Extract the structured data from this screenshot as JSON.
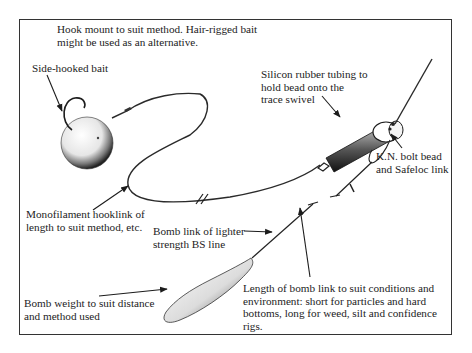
{
  "diagram": {
    "type": "fishing-rig-illustration",
    "labels": {
      "hook_mount": [
        "Hook mount to suit method. Hair-rigged bait",
        "might be used as an alternative."
      ],
      "side_hooked_bait": [
        "Side-hooked bait"
      ],
      "silicon_tubing": [
        "Silicon rubber tubing to",
        "hold bead onto the",
        "trace swivel"
      ],
      "kn_bolt_bead": [
        "K.N. bolt bead",
        "and Safeloc link"
      ],
      "monofilament": [
        "Monofilament hooklink of",
        "length to suit method, etc."
      ],
      "bomb_link": [
        "Bomb link of lighter",
        "strength BS line"
      ],
      "bomb_weight": [
        "Bomb weight to suit distance",
        "and method used"
      ],
      "bomb_link_length": [
        "Length of bomb link to suit conditions and",
        "environment: short for particles and hard",
        "bottoms, long for weed, silt and confidence",
        "rigs."
      ]
    },
    "components": [
      "boilie-bait",
      "hook",
      "hooklink",
      "swivel",
      "silicon-tubing",
      "bolt-bead",
      "safeloc-link",
      "main-line",
      "bomb-link",
      "bomb-weight"
    ],
    "colors": {
      "ink": "#1c1c1c",
      "background": "#ffffff",
      "frame": "#333333"
    }
  }
}
